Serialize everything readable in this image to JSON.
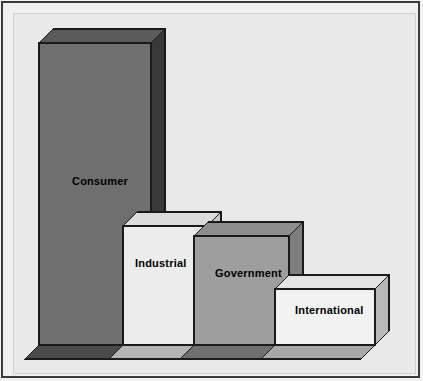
{
  "chart_data": {
    "type": "bar",
    "title": "",
    "subtitle": "",
    "xlabel": "",
    "ylabel": "",
    "grid": false,
    "legend_position": "none",
    "style": "3d-isometric-bars",
    "categories": [
      "Consumer",
      "Industrial",
      "Government",
      "International"
    ],
    "values": [
      100,
      40,
      33,
      16
    ],
    "ylim": [
      0,
      100
    ],
    "annotations": [
      "Labels are drawn inside each bar face"
    ],
    "series": [
      {
        "name": "Share",
        "values": [
          100,
          40,
          33,
          16
        ]
      }
    ],
    "tick_labels": [],
    "axis_visible": false
  },
  "figure": {
    "background_color": "#e9e9e9",
    "frame_color": "#3a3a3a",
    "page_color": "#f0f0f0"
  },
  "bars": [
    {
      "label": "Consumer",
      "face_color": "#6f6f6f",
      "side_color": "#393939",
      "top_color": "#5a5a5a",
      "bottom_color": "#4a4a4a",
      "outline_color": "#1a1a1a",
      "label_color": "#000000",
      "front": {
        "x": 26,
        "y": 30,
        "w": 112,
        "h": 302
      },
      "depth": {
        "dx": 14,
        "dy": -14
      }
    },
    {
      "label": "Industrial",
      "face_color": "#ececec",
      "side_color": "#c8c8c8",
      "top_color": "#dcdcdc",
      "bottom_color": "#b4b4b4",
      "outline_color": "#1a1a1a",
      "label_color": "#000000",
      "front": {
        "x": 110,
        "y": 213,
        "w": 84,
        "h": 119
      },
      "depth": {
        "dx": 14,
        "dy": -14
      }
    },
    {
      "label": "Government",
      "face_color": "#9e9e9e",
      "side_color": "#7d7d7d",
      "top_color": "#8d8d8d",
      "bottom_color": "#6f6f6f",
      "outline_color": "#1a1a1a",
      "label_color": "#000000",
      "front": {
        "x": 181,
        "y": 223,
        "w": 95,
        "h": 109
      },
      "depth": {
        "dx": 14,
        "dy": -14
      }
    },
    {
      "label": "International",
      "face_color": "#f2f2f2",
      "side_color": "#b9b9b9",
      "top_color": "#e4e4e4",
      "bottom_color": "#a8a8a8",
      "outline_color": "#1a1a1a",
      "label_color": "#000000",
      "front": {
        "x": 262,
        "y": 276,
        "w": 100,
        "h": 56
      },
      "depth": {
        "dx": 14,
        "dy": -14
      }
    }
  ],
  "labels": [
    {
      "text": "Consumer",
      "x": 59,
      "y": 168
    },
    {
      "text": "Industrial",
      "x": 122,
      "y": 250
    },
    {
      "text": "Government",
      "x": 202,
      "y": 260
    },
    {
      "text": "International",
      "x": 282,
      "y": 297
    }
  ]
}
